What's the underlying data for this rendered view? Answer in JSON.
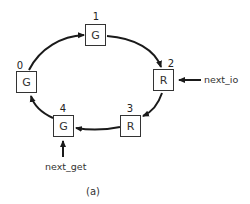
{
  "diagram": {
    "caption": "(a)",
    "nodes": [
      {
        "index": "0",
        "state": "G"
      },
      {
        "index": "1",
        "state": "G"
      },
      {
        "index": "2",
        "state": "R"
      },
      {
        "index": "3",
        "state": "R"
      },
      {
        "index": "4",
        "state": "G"
      }
    ],
    "edges": [
      {
        "from": "0",
        "to": "1"
      },
      {
        "from": "1",
        "to": "2"
      },
      {
        "from": "2",
        "to": "3"
      },
      {
        "from": "3",
        "to": "4"
      },
      {
        "from": "4",
        "to": "0"
      }
    ],
    "pointers": {
      "next_io": {
        "label": "next_io",
        "target": "2"
      },
      "next_get": {
        "label": "next_get",
        "target": "4"
      }
    },
    "colors": {
      "stroke": "#1a1a1a",
      "box_border": "#333333",
      "background": "#ffffff"
    }
  }
}
